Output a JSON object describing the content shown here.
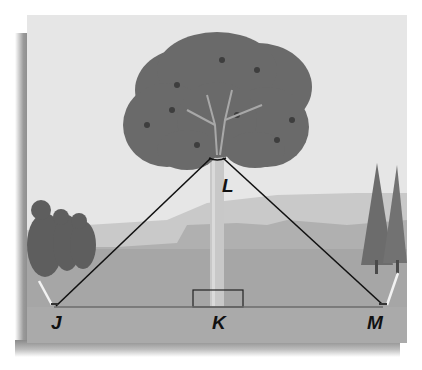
{
  "figure": {
    "points": {
      "J": {
        "label": "J"
      },
      "K": {
        "label": "K"
      },
      "L": {
        "label": "L"
      },
      "M": {
        "label": "M"
      }
    },
    "segments": [
      "JL",
      "LM",
      "JK",
      "KM",
      "LK"
    ],
    "right_angle_at": "K",
    "colors": {
      "sky": "#e6e6e6",
      "far_hills": "#c4c4c4",
      "near_hills": "#a9a9a9",
      "ground": "#a3a3a3",
      "canopy": "#6a6a6a",
      "trunk": "#c8c8c8",
      "wire": "#111111"
    }
  }
}
